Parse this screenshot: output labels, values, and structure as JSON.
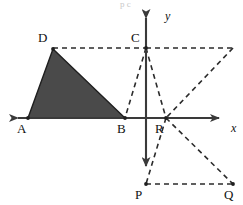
{
  "figure": {
    "title": "",
    "width": 243,
    "height": 205,
    "background_color": "#ffffff",
    "stroke_color": "#3a3a3a",
    "shade_color": "#4a4a4a",
    "dash_color": "#2b2b2b"
  },
  "axes": {
    "x_label": "x",
    "y_label": "y",
    "origin": {
      "x": 146,
      "y": 118
    },
    "x_axis": {
      "x1": 5,
      "y1": 118,
      "x2": 228,
      "y2": 118,
      "arrows": "both"
    },
    "y_axis": {
      "x1": 146,
      "y1": 8,
      "x2": 146,
      "y2": 175,
      "arrows": "both"
    }
  },
  "points": [
    {
      "name": "A",
      "label": "A",
      "x": 28,
      "y": 118,
      "label_x": 17,
      "label_y": 122
    },
    {
      "name": "B",
      "label": "B",
      "x": 125,
      "y": 118,
      "label_x": 117,
      "label_y": 122
    },
    {
      "name": "C",
      "label": "C",
      "x": 146,
      "y": 48,
      "label_x": 131,
      "label_y": 31
    },
    {
      "name": "D",
      "label": "D",
      "x": 53,
      "y": 49,
      "label_x": 38,
      "label_y": 31
    },
    {
      "name": "P",
      "label": "P",
      "x": 146,
      "y": 184,
      "label_x": 135,
      "label_y": 188
    },
    {
      "name": "Q",
      "label": "Q",
      "x": 233,
      "y": 184,
      "label_x": 224,
      "label_y": 188
    },
    {
      "name": "R",
      "label": "R",
      "x": 166,
      "y": 118,
      "label_x": 155,
      "label_y": 122
    },
    {
      "name": "E",
      "label": "",
      "x": 233,
      "y": 48,
      "label_x": 0,
      "label_y": 0
    }
  ],
  "shaded_triangle": {
    "name": "triangle-ADB",
    "vertices": "28,118 53,49 125,118",
    "fill": "#4a4a4a",
    "stroke": "#1f1f1f"
  },
  "dashed_segments": [
    {
      "name": "segment-D-C",
      "x1": 53,
      "y1": 48,
      "x2": 146,
      "y2": 48
    },
    {
      "name": "segment-C-E",
      "x1": 146,
      "y1": 48,
      "x2": 233,
      "y2": 48
    },
    {
      "name": "segment-C-B",
      "x1": 146,
      "y1": 48,
      "x2": 125,
      "y2": 118
    },
    {
      "name": "segment-C-R",
      "x1": 146,
      "y1": 48,
      "x2": 166,
      "y2": 118
    },
    {
      "name": "segment-E-R",
      "x1": 233,
      "y1": 48,
      "x2": 166,
      "y2": 118
    },
    {
      "name": "segment-R-P",
      "x1": 166,
      "y1": 118,
      "x2": 146,
      "y2": 184
    },
    {
      "name": "segment-R-Q",
      "x1": 166,
      "y1": 118,
      "x2": 233,
      "y2": 184
    },
    {
      "name": "segment-P-Q",
      "x1": 146,
      "y1": 184,
      "x2": 233,
      "y2": 184
    }
  ],
  "artifacts": {
    "top_marks": "p    c"
  }
}
